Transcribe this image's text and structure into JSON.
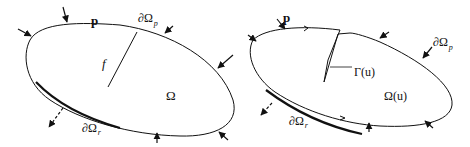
{
  "left_figure": {
    "load_label": "p",
    "boundary_p_label": "∂Ω",
    "boundary_p_sub": "p",
    "force_label": "f",
    "domain_label": "Ω",
    "boundary_r_label": "∂Ω",
    "boundary_r_sub": "r"
  },
  "right_figure": {
    "load_label": "p",
    "boundary_p_label": "∂Ω",
    "boundary_p_sub": "p",
    "crack_label": "Γ(u)",
    "domain_label": "Ω(u)",
    "boundary_r_label": "∂Ω",
    "boundary_r_sub": "r"
  }
}
